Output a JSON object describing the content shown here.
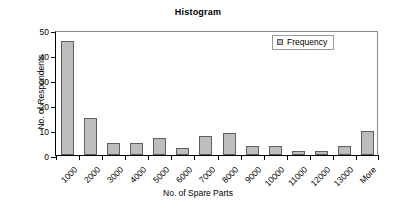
{
  "chart_data": {
    "type": "bar",
    "title": "Histogram",
    "xlabel": "No. of Spare Parts",
    "ylabel": "No. of Respondents",
    "categories": [
      "1000",
      "2000",
      "3000",
      "4000",
      "5000",
      "6000",
      "7000",
      "8000",
      "9000",
      "10000",
      "11000",
      "12000",
      "13000",
      "More"
    ],
    "values": [
      45.5,
      15,
      5,
      5,
      7,
      3,
      7.5,
      9,
      3.5,
      3.5,
      1.5,
      1.5,
      3.5,
      9.5
    ],
    "ylim": [
      0,
      50
    ],
    "yticks": [
      0,
      10,
      20,
      30,
      40,
      50
    ],
    "ytick_labels": [
      "0",
      "10",
      "20",
      "30",
      "40",
      "50"
    ],
    "grid": false,
    "legend": {
      "position": "top-right",
      "entries": [
        {
          "label": "Frequency",
          "color": "#bdbdbd",
          "marker": "square"
        }
      ]
    },
    "series": [
      {
        "name": "Frequency",
        "values": [
          45.5,
          15,
          5,
          5,
          7,
          3,
          7.5,
          9,
          3.5,
          3.5,
          1.5,
          1.5,
          3.5,
          9.5
        ]
      }
    ],
    "colors": {
      "bar_fill": "#bdbdbd",
      "bar_stroke": "#5e5e5e",
      "axis": "#000000",
      "background": "#ffffff"
    }
  }
}
